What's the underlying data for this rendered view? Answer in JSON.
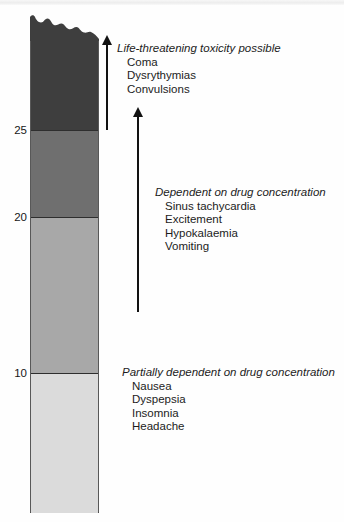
{
  "figure": {
    "scale": {
      "labels": [
        {
          "value": "25"
        },
        {
          "value": "20"
        },
        {
          "value": "10"
        }
      ]
    },
    "bar": {
      "colors": {
        "top": "#3e3e3e",
        "upper_mid": "#6f6f6f",
        "lower_mid": "#a8a8a8",
        "bottom": "#dbdbdb"
      }
    },
    "annotations": [
      {
        "heading": "Life-threatening toxicity possible",
        "items": [
          "Coma",
          "Dysrythymias",
          "Convulsions"
        ]
      },
      {
        "heading": "Dependent on drug concentration",
        "items": [
          "Sinus tachycardia",
          "Excitement",
          "Hypokalaemia",
          "Vomiting"
        ]
      },
      {
        "heading": "Partially dependent on drug concentration",
        "items": [
          "Nausea",
          "Dyspepsia",
          "Insomnia",
          "Headache"
        ]
      }
    ]
  }
}
